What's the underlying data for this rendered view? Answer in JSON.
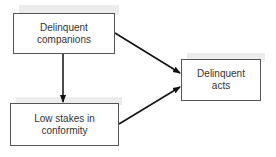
{
  "diagram": {
    "nodes": [
      {
        "id": "companions",
        "label": "Delinquent companions",
        "line1": "Delinquent",
        "line2": "companions"
      },
      {
        "id": "stakes",
        "label": "Low stakes in conformity",
        "line1": "Low stakes in",
        "line2": "conformity"
      },
      {
        "id": "acts",
        "label": "Delinquent acts",
        "line1": "Delinquent",
        "line2": "acts"
      }
    ],
    "edges": [
      {
        "from": "companions",
        "to": "stakes"
      },
      {
        "from": "companions",
        "to": "acts"
      },
      {
        "from": "stakes",
        "to": "acts"
      }
    ]
  }
}
